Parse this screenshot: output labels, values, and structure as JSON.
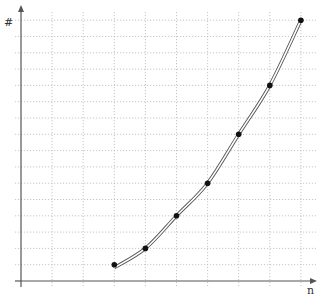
{
  "chart_data": {
    "type": "line",
    "title": "",
    "xlabel": "n",
    "ylabel": "#",
    "x": [
      3,
      4,
      5,
      6,
      7,
      8,
      9
    ],
    "series": [
      {
        "name": "",
        "values": [
          1,
          2,
          4,
          6,
          9,
          12,
          16
        ]
      }
    ],
    "xlim": [
      0,
      9.5
    ],
    "ylim": [
      0,
      16.5
    ],
    "grid": true,
    "grid_style": "dotted",
    "x_grid_step": 1,
    "y_grid_step": 1,
    "tick_labels_shown": false,
    "legend": null,
    "line_style": "double-outline",
    "marker": "filled-circle"
  },
  "axes": {
    "x_label": "n",
    "y_label": "#"
  },
  "colors": {
    "grid": "#b8b8b8",
    "axis": "#555555",
    "line_outer": "#555555",
    "line_inner": "#ffffff",
    "marker": "#111111"
  }
}
